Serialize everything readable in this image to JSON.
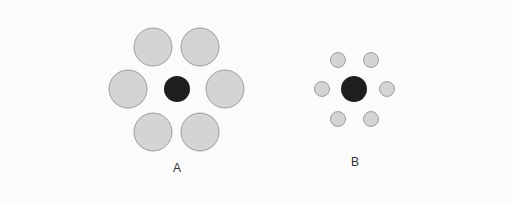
{
  "colors": {
    "background": "#fbfbfb",
    "outer_fill": "#d4d4d4",
    "outer_stroke": "#8a8a8a",
    "center_fill": "#1e1e1e"
  },
  "groups": [
    {
      "label": "A",
      "label_pos": [
        177,
        172
      ],
      "center": {
        "cx": 177,
        "cy": 89,
        "r": 13
      },
      "outer_r": 19,
      "outer": [
        [
          153,
          47
        ],
        [
          200,
          47
        ],
        [
          128,
          89
        ],
        [
          225,
          89
        ],
        [
          153,
          132
        ],
        [
          200,
          132
        ]
      ]
    },
    {
      "label": "B",
      "label_pos": [
        355,
        166
      ],
      "center": {
        "cx": 354,
        "cy": 89,
        "r": 13
      },
      "outer_r": 7.5,
      "outer": [
        [
          338,
          60
        ],
        [
          371,
          60
        ],
        [
          322,
          89
        ],
        [
          387,
          89
        ],
        [
          338,
          119
        ],
        [
          371,
          119
        ]
      ]
    }
  ]
}
